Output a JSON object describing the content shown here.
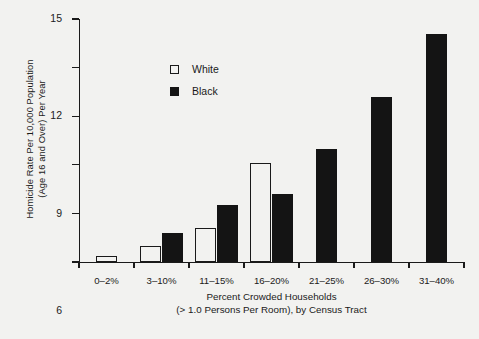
{
  "chart_data": {
    "type": "bar",
    "title": "",
    "subtitle": "",
    "categories": [
      "0–2%",
      "3–10%",
      "11–15%",
      "16–20%",
      "21–25%",
      "26–30%",
      "31–40%"
    ],
    "series": [
      {
        "name": "White",
        "values": [
          0.4,
          1.0,
          2.1,
          6.1,
          null,
          null,
          null
        ],
        "color": "#f2f2f0",
        "edge_color": "#1a1a1a"
      },
      {
        "name": "Black",
        "values": [
          null,
          1.8,
          3.5,
          4.2,
          7.0,
          10.2,
          14.1
        ],
        "color": "#141414",
        "edge_color": "#141414"
      }
    ],
    "xlabel_line1": "Percent Crowded Households",
    "xlabel_line2": "(> 1.0 Persons Per Room), by Census Tract",
    "ylabel_line1": "Homicide Rate Per 10,000 Population",
    "ylabel_line2": "(Age 16 and Over) Per Year",
    "ylim": [
      0,
      15
    ],
    "yticks": [
      0,
      3,
      6,
      9,
      12,
      15
    ],
    "ytick_labels": [
      "0",
      "3",
      "6",
      "9",
      "12",
      "15"
    ],
    "grid": false,
    "legend_position": "upper-left-inside",
    "legend": [
      {
        "label": "White",
        "swatch": "hollow-square"
      },
      {
        "label": "Black",
        "swatch": "filled-square"
      }
    ],
    "background_color": "#f2f2f0",
    "axis_color": "#1a1a1a"
  }
}
